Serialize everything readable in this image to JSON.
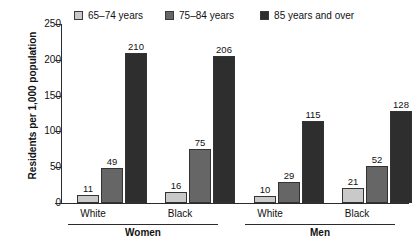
{
  "chart_data": {
    "type": "bar",
    "title": "",
    "xlabel": "",
    "ylabel": "Residents per 1,000 population",
    "ylim": [
      0,
      250
    ],
    "yticks": [
      0,
      50,
      100,
      150,
      200,
      250
    ],
    "grid": false,
    "legend_position": "top",
    "categories": [
      "White",
      "Black",
      "White",
      "Black"
    ],
    "supergroups": [
      {
        "label": "Women",
        "categories": [
          "White",
          "Black"
        ]
      },
      {
        "label": "Men",
        "categories": [
          "White",
          "Black"
        ]
      }
    ],
    "series": [
      {
        "name": "65–74 years",
        "color": "#c9c9c9",
        "values": [
          11,
          16,
          10,
          21
        ]
      },
      {
        "name": "75–84 years",
        "color": "#666666",
        "values": [
          49,
          75,
          29,
          52
        ]
      },
      {
        "name": "85 years and over",
        "color": "#2e2e2e",
        "values": [
          210,
          206,
          115,
          128
        ]
      }
    ],
    "data_labels": [
      [
        "11",
        "49",
        "210"
      ],
      [
        "16",
        "75",
        "206"
      ],
      [
        "10",
        "29",
        "115"
      ],
      [
        "21",
        "52",
        "128"
      ]
    ]
  },
  "legend": {
    "items": [
      {
        "label": "65–74 years",
        "color": "#c9c9c9"
      },
      {
        "label": "75–84 years",
        "color": "#666666"
      },
      {
        "label": "85 years and over",
        "color": "#2e2e2e"
      }
    ]
  },
  "yaxis": {
    "title": "Residents per 1,000 population",
    "ticks": [
      "250",
      "200",
      "150",
      "100",
      "50",
      "0"
    ]
  },
  "xaxis": {
    "category_labels": [
      "White",
      "Black",
      "White",
      "Black"
    ],
    "group_labels": [
      "Women",
      "Men"
    ]
  }
}
